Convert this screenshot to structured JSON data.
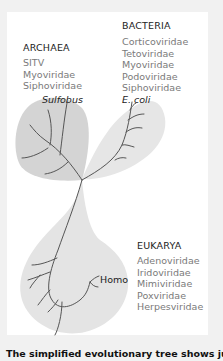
{
  "domains": {
    "archaea": {
      "title": "ARCHAEA",
      "viruses": [
        "SITV",
        "Myoviridae",
        "Siphoviridae"
      ],
      "organism": "Sulfobus"
    },
    "bacteria": {
      "title": "BACTERIA",
      "viruses": [
        "Corticoviridae",
        "Tetoviridae",
        "Myoviridae",
        "Podoviridae",
        "Siphoviridae"
      ],
      "organism": "E. coli"
    },
    "eukarya": {
      "title": "EUKARYA",
      "viruses": [
        "Adenoviridae",
        "Iridoviridae",
        "Mimiviridae",
        "Poxviridae",
        "Herpesviridae"
      ],
      "organism": "Homo"
    }
  },
  "colors": {
    "archaea_fill": "#d4d4d4",
    "bacteria_fill": "#e6e6e6",
    "eukarya_fill": "#e4e4e4",
    "branch": "#555555"
  },
  "caption": "The simplified evolutionary tree shows just"
}
